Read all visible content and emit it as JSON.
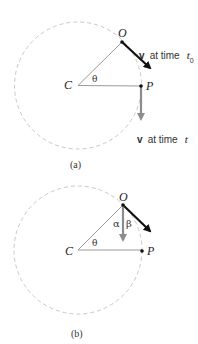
{
  "colors": {
    "circle": "#c8c8c8",
    "radius_line": "#9a9a9a",
    "velocity_initial": "#111111",
    "velocity_other": "#8c8c8c",
    "text": "#222222"
  },
  "panel_a": {
    "caption": "(a)",
    "points": {
      "center": "C",
      "start": "O",
      "end": "P"
    },
    "angle_label": "θ",
    "vector_symbol": "v",
    "velocity_initial_label": "at time",
    "velocity_initial_time": "t",
    "velocity_initial_subscript": "0",
    "velocity_later_label": "at time",
    "velocity_later_time": "t"
  },
  "panel_b": {
    "caption": "(b)",
    "points": {
      "center": "C",
      "start": "O",
      "end": "P"
    },
    "angle_theta": "θ",
    "angle_alpha": "α",
    "angle_beta": "β"
  }
}
